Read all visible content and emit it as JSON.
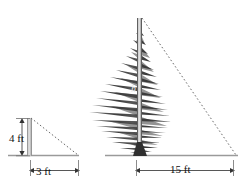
{
  "figure": {
    "background_color": "#ffffff",
    "line_color": "#8a8a8a",
    "dashed_color": "#6b6b6b",
    "tree_color": "#4a4a4a",
    "text_color": "#111111"
  },
  "small_triangle": {
    "name": "stick-and-shadow-triangle",
    "vertical_label": "4 ft",
    "horizontal_label": "3 ft",
    "vertical_value": 4,
    "horizontal_value": 3,
    "units": "ft"
  },
  "large_triangle": {
    "name": "tree-and-shadow-triangle",
    "vertical_label": "h",
    "horizontal_label": "15 ft",
    "horizontal_value": 15,
    "units": "ft"
  },
  "icons": {
    "tree": "conifer-tree-icon",
    "post": "vertical-post-icon"
  }
}
